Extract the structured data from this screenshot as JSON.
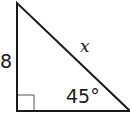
{
  "diagram": {
    "type": "right-triangle",
    "colors": {
      "stroke": "#1a1a1a",
      "background": "#ffffff"
    },
    "labels": {
      "leg": "8",
      "hypotenuse": "x",
      "angle": "45°"
    },
    "right_angle_marker": true
  }
}
